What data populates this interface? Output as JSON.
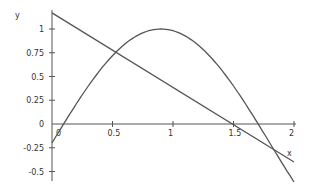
{
  "chart_data": {
    "type": "line",
    "title": "",
    "xlabel": "x",
    "ylabel": "y",
    "xlim": [
      0,
      2
    ],
    "ylim": [
      -0.55,
      1.2
    ],
    "x_ticks": [
      "0",
      "0.5",
      "1",
      "1.5",
      "2"
    ],
    "y_ticks": [
      "1",
      "0.75",
      "0.5",
      "0.25",
      "0",
      "-0.25",
      "-0.5"
    ],
    "grid": false,
    "series": [
      {
        "name": "line",
        "formula": "y = 1.17 - 0.785x",
        "x": [
          0,
          2
        ],
        "y": [
          1.17,
          -0.4
        ]
      },
      {
        "name": "curve",
        "formula": "y = 1.2 sin(pi x / 1.8) - 0.2",
        "x": [
          0,
          0.25,
          0.5,
          0.75,
          0.9,
          1.0,
          1.25,
          1.5,
          1.75,
          2.0
        ],
        "y": [
          -0.2,
          0.31,
          0.72,
          0.96,
          1.0,
          0.98,
          0.73,
          0.4,
          -0.11,
          -0.61
        ]
      }
    ]
  }
}
